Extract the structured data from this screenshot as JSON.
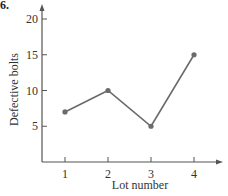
{
  "problem_number": "6.",
  "chart_data": {
    "type": "line",
    "title": "",
    "xlabel": "Lot number",
    "ylabel": "Defective bolts",
    "categories": [
      "1",
      "2",
      "3",
      "4"
    ],
    "x": [
      1,
      2,
      3,
      4
    ],
    "values": [
      7,
      10,
      5,
      15
    ],
    "yticks": [
      5,
      10,
      15,
      20
    ],
    "xticks": [
      1,
      2,
      3,
      4
    ],
    "ylim": [
      0,
      21
    ],
    "xlim": [
      0.5,
      4.7
    ],
    "grid": false,
    "legend": null,
    "line_color": "#6b6b6b",
    "marker_color": "#6b6b6b"
  }
}
